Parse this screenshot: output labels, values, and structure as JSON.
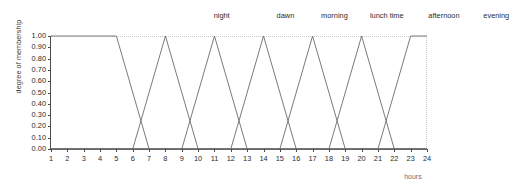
{
  "chart_data": {
    "type": "line",
    "title": "",
    "xlabel": "hours",
    "ylabel": "degree of membership",
    "xlim": [
      1,
      24
    ],
    "ylim": [
      0,
      1
    ],
    "grid": false,
    "legend_position": "top-inline",
    "x_ticks": [
      1,
      2,
      3,
      4,
      5,
      6,
      7,
      8,
      9,
      10,
      11,
      12,
      13,
      14,
      15,
      16,
      17,
      18,
      19,
      20,
      21,
      22,
      23,
      24
    ],
    "x_tick_labels": [
      "1",
      "2",
      "3",
      "4",
      "5",
      "6",
      "7",
      "8",
      "9",
      "10",
      "11",
      "12",
      "13",
      "14",
      "15",
      "16",
      "17",
      "18",
      "19",
      "20",
      "21",
      "22",
      "23",
      "24"
    ],
    "y_ticks": [
      0,
      0.1,
      0.2,
      0.3,
      0.4,
      0.5,
      0.6,
      0.7,
      0.8,
      0.9,
      1
    ],
    "y_tick_labels": [
      "0.00",
      "0.10",
      "0.20",
      "0.30",
      "0.40",
      "0.50",
      "0.60",
      "0.70",
      "0.80",
      "0.90",
      "1.00"
    ],
    "series": [
      {
        "name": "night",
        "label_x": 11.5,
        "points": [
          [
            1,
            1
          ],
          [
            5,
            1
          ],
          [
            7,
            0
          ],
          [
            21,
            0
          ],
          [
            23,
            1
          ],
          [
            24,
            1
          ]
        ]
      },
      {
        "name": "dawn",
        "label_x": 15.4,
        "points": [
          [
            1,
            0
          ],
          [
            6,
            0
          ],
          [
            8,
            1
          ],
          [
            10,
            0
          ],
          [
            24,
            0
          ]
        ]
      },
      {
        "name": "morning",
        "label_x": 18.4,
        "points": [
          [
            1,
            0
          ],
          [
            9,
            0
          ],
          [
            11,
            1
          ],
          [
            13,
            0
          ],
          [
            24,
            0
          ]
        ]
      },
      {
        "name": "lunch time",
        "label_x": 21.6,
        "points": [
          [
            1,
            0
          ],
          [
            12,
            0
          ],
          [
            14,
            1
          ],
          [
            16,
            0
          ],
          [
            24,
            0
          ]
        ]
      },
      {
        "name": "afternoon",
        "label_x": 25.1,
        "points": [
          [
            1,
            0
          ],
          [
            15,
            0
          ],
          [
            17,
            1
          ],
          [
            19,
            0
          ],
          [
            24,
            0
          ]
        ]
      },
      {
        "name": "evening",
        "label_x": 28.3,
        "points": [
          [
            1,
            0
          ],
          [
            18,
            0
          ],
          [
            20,
            1
          ],
          [
            22,
            0
          ],
          [
            24,
            0
          ]
        ]
      }
    ],
    "colors": {
      "line": "#6b6b6b",
      "axis": "#4a4a4a",
      "grid": "#c9c9c9",
      "text": "#2b2b2b",
      "background": "#ffffff"
    }
  }
}
